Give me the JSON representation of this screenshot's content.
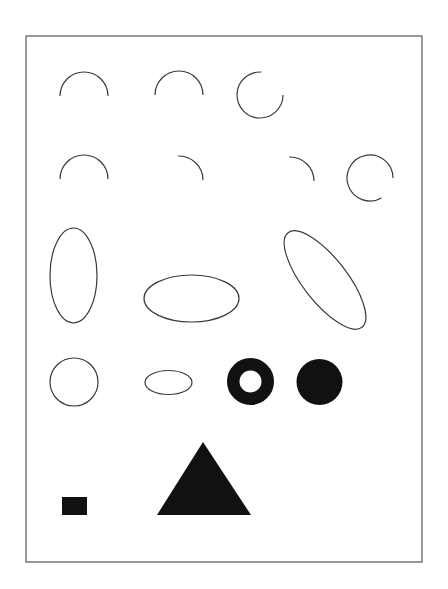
{
  "page": {
    "width": 448,
    "height": 589,
    "background": "#ffffff"
  },
  "colors": {
    "stroke": "#3a3a3a",
    "fill": "#111111",
    "border": "#555555"
  },
  "frame": {
    "x": 26,
    "y": 36,
    "width": 396,
    "height": 526
  },
  "shapes": {
    "row1": [
      {
        "type": "arc",
        "cx": 84,
        "cy": 96,
        "r": 24,
        "start_deg": 180,
        "end_deg": 360,
        "desc": "upper semicircle"
      },
      {
        "type": "arc",
        "cx": 179,
        "cy": 95,
        "r": 24,
        "start_deg": 180,
        "end_deg": 360,
        "desc": "upper semicircle"
      },
      {
        "type": "arc",
        "cx": 260,
        "cy": 95,
        "r": 23,
        "start_deg": 0,
        "end_deg": 273,
        "desc": "three-quarter arc open at top-right"
      }
    ],
    "row2": [
      {
        "type": "arc",
        "cx": 84,
        "cy": 179,
        "r": 24,
        "start_deg": 180,
        "end_deg": 360,
        "desc": "upper semicircle"
      },
      {
        "type": "arc",
        "cx": 179,
        "cy": 180,
        "r": 24,
        "start_deg": 268,
        "end_deg": 360,
        "desc": "quarter arc top-right"
      },
      {
        "type": "arc",
        "cx": 290,
        "cy": 181,
        "r": 24,
        "start_deg": 268,
        "end_deg": 360,
        "desc": "quarter arc top-right"
      },
      {
        "type": "arc",
        "cx": 370,
        "cy": 178,
        "r": 23,
        "start_deg": 60,
        "end_deg": 360,
        "desc": "arc open at bottom-right"
      }
    ],
    "row3": [
      {
        "type": "ellipse",
        "cx": 73.5,
        "cy": 275.5,
        "rx": 23.5,
        "ry": 47.5,
        "rotate": 0,
        "desc": "vertical ellipse"
      },
      {
        "type": "ellipse",
        "cx": 191.5,
        "cy": 298.5,
        "rx": 47.5,
        "ry": 23.5,
        "rotate": 0,
        "desc": "horizontal ellipse"
      },
      {
        "type": "ellipse",
        "cx": 325,
        "cy": 280,
        "rx": 60,
        "ry": 22,
        "rotate": 52,
        "desc": "tilted ellipse"
      }
    ],
    "row4": [
      {
        "type": "circle",
        "cx": 74,
        "cy": 382,
        "r": 24,
        "desc": "outline circle"
      },
      {
        "type": "ellipse",
        "cx": 168.5,
        "cy": 382.5,
        "rx": 23.5,
        "ry": 12,
        "rotate": 0,
        "desc": "small horizontal ellipse"
      },
      {
        "type": "ring",
        "cx": 250.5,
        "cy": 381.5,
        "r_outer": 23.5,
        "r_inner": 11,
        "desc": "filled ring"
      },
      {
        "type": "disc",
        "cx": 319.5,
        "cy": 382,
        "r": 23,
        "desc": "filled circle"
      }
    ],
    "row5": [
      {
        "type": "rect",
        "x": 62,
        "y": 497,
        "width": 25,
        "height": 18,
        "desc": "filled rectangle"
      },
      {
        "type": "triangle",
        "points": [
          [
            203,
            442
          ],
          [
            157,
            515
          ],
          [
            251,
            515
          ]
        ],
        "desc": "filled triangle"
      }
    ]
  }
}
